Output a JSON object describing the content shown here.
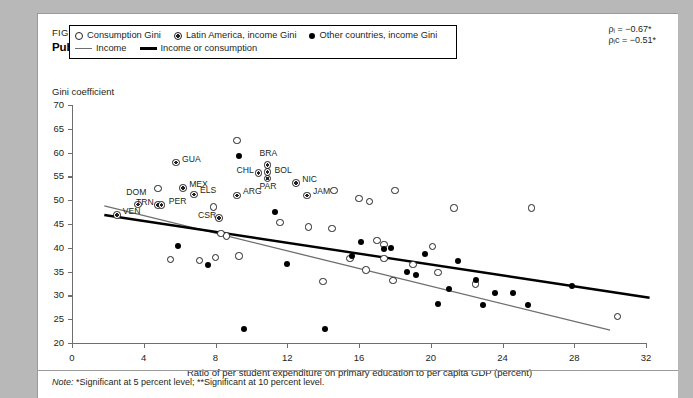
{
  "figure": {
    "label": "FIGURE 6.15",
    "title": "Public expenditure on primary education and income inequality",
    "note_prefix": "Note:",
    "note": "*Significant at 5 percent level; **Significant at 10 percent level."
  },
  "annotations": {
    "rho_income": "ρᵢ = −0.67*",
    "rho_income_consumption": "ρᵢᴄ = −0.51*"
  },
  "legend": {
    "items": [
      {
        "marker": "open-circle",
        "label": "Consumption Gini"
      },
      {
        "marker": "half-circle",
        "label": "Latin America, income Gini"
      },
      {
        "marker": "filled-circle",
        "label": "Other countries, income Gini"
      },
      {
        "marker": "thin-gray-line",
        "label": "Income"
      },
      {
        "marker": "thick-black-line",
        "label": "Income or consumption"
      }
    ]
  },
  "chart_data": {
    "type": "scatter",
    "title": "Public expenditure on primary education and income inequality",
    "xlabel": "Ratio of per student expenditure on primary education to per capita GDP (percent)",
    "ylabel": "Gini coefficient",
    "xlim": [
      0,
      32
    ],
    "ylim": [
      20,
      70
    ],
    "xticks": [
      0,
      4,
      8,
      12,
      16,
      20,
      24,
      28,
      32
    ],
    "yticks": [
      20,
      25,
      30,
      35,
      40,
      45,
      50,
      55,
      60,
      65,
      70
    ],
    "grid": false,
    "legend_position": "top-left inside",
    "series": [
      {
        "name": "Latin America, income Gini",
        "marker": "half-circle",
        "points": [
          {
            "label": "GUA",
            "x": 5.8,
            "y": 57.9
          },
          {
            "label": "MEX",
            "x": 6.2,
            "y": 52.6
          },
          {
            "label": "ELS",
            "x": 6.8,
            "y": 51.2
          },
          {
            "label": "BRA",
            "x": 10.9,
            "y": 57.4
          },
          {
            "label": "CHL",
            "x": 10.4,
            "y": 55.7
          },
          {
            "label": "BOL",
            "x": 10.9,
            "y": 55.9
          },
          {
            "label": "PAR",
            "x": 10.9,
            "y": 54.5
          },
          {
            "label": "NIC",
            "x": 12.5,
            "y": 53.6
          },
          {
            "label": "ARG",
            "x": 9.2,
            "y": 51.0
          },
          {
            "label": "JAM",
            "x": 13.1,
            "y": 51.0
          },
          {
            "label": "DOM",
            "x": 3.7,
            "y": 49.1
          },
          {
            "label": "TRN",
            "x": 4.8,
            "y": 49.0
          },
          {
            "label": "PER",
            "x": 5.0,
            "y": 49.0
          },
          {
            "label": "VEN",
            "x": 2.5,
            "y": 46.9
          },
          {
            "label": "CSR",
            "x": 8.2,
            "y": 46.3
          }
        ]
      },
      {
        "name": "Consumption Gini",
        "marker": "open-circle",
        "points": [
          {
            "x": 9.2,
            "y": 62.5
          },
          {
            "x": 4.8,
            "y": 52.5
          },
          {
            "x": 7.9,
            "y": 48.6
          },
          {
            "x": 14.6,
            "y": 52.0
          },
          {
            "x": 18.0,
            "y": 52.1
          },
          {
            "x": 16.0,
            "y": 50.3
          },
          {
            "x": 16.6,
            "y": 49.7
          },
          {
            "x": 21.3,
            "y": 48.4
          },
          {
            "x": 25.6,
            "y": 48.4
          },
          {
            "x": 11.6,
            "y": 45.3
          },
          {
            "x": 13.2,
            "y": 44.4
          },
          {
            "x": 14.5,
            "y": 44.0
          },
          {
            "x": 8.3,
            "y": 43.0
          },
          {
            "x": 8.6,
            "y": 42.5
          },
          {
            "x": 17.0,
            "y": 41.5
          },
          {
            "x": 17.4,
            "y": 40.7
          },
          {
            "x": 20.1,
            "y": 40.3
          },
          {
            "x": 5.5,
            "y": 37.6
          },
          {
            "x": 7.1,
            "y": 37.3
          },
          {
            "x": 8.0,
            "y": 38.0
          },
          {
            "x": 9.3,
            "y": 38.3
          },
          {
            "x": 15.5,
            "y": 37.7
          },
          {
            "x": 17.4,
            "y": 37.8
          },
          {
            "x": 16.4,
            "y": 35.3
          },
          {
            "x": 19.0,
            "y": 36.5
          },
          {
            "x": 20.4,
            "y": 34.8
          },
          {
            "x": 17.9,
            "y": 33.1
          },
          {
            "x": 14.0,
            "y": 32.9
          },
          {
            "x": 22.5,
            "y": 32.4
          },
          {
            "x": 30.4,
            "y": 25.6
          }
        ]
      },
      {
        "name": "Other countries, income Gini",
        "marker": "filled-circle",
        "points": [
          {
            "x": 9.3,
            "y": 59.3
          },
          {
            "x": 11.3,
            "y": 47.5
          },
          {
            "x": 5.9,
            "y": 40.4
          },
          {
            "x": 7.6,
            "y": 36.4
          },
          {
            "x": 12.0,
            "y": 36.7
          },
          {
            "x": 15.6,
            "y": 38.3
          },
          {
            "x": 16.1,
            "y": 41.3
          },
          {
            "x": 17.4,
            "y": 39.8
          },
          {
            "x": 17.8,
            "y": 39.9
          },
          {
            "x": 19.7,
            "y": 38.6
          },
          {
            "x": 21.5,
            "y": 37.3
          },
          {
            "x": 18.7,
            "y": 35.0
          },
          {
            "x": 19.2,
            "y": 34.3
          },
          {
            "x": 22.5,
            "y": 33.3
          },
          {
            "x": 21.0,
            "y": 31.4
          },
          {
            "x": 23.6,
            "y": 30.5
          },
          {
            "x": 24.6,
            "y": 30.4
          },
          {
            "x": 20.4,
            "y": 28.2
          },
          {
            "x": 22.9,
            "y": 28.0
          },
          {
            "x": 25.4,
            "y": 28.0
          },
          {
            "x": 27.9,
            "y": 31.9
          },
          {
            "x": 9.6,
            "y": 22.9
          },
          {
            "x": 14.1,
            "y": 22.9
          }
        ]
      }
    ],
    "trendlines": [
      {
        "name": "Income",
        "style": "thin-gray-line",
        "x0": 1.8,
        "y0": 48.8,
        "x1": 30.0,
        "y1": 22.7
      },
      {
        "name": "Income or consumption",
        "style": "thick-black-line",
        "x0": 1.8,
        "y0": 46.9,
        "x1": 32.2,
        "y1": 29.5
      }
    ]
  }
}
